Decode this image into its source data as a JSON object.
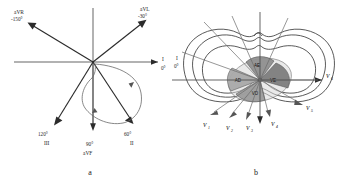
{
  "figure": {
    "background_color": "#ffffff",
    "ink_color": "#1f1f1f"
  },
  "panels": [
    {
      "id": "a",
      "caption": "a",
      "kind": "frontal-plane-hexaxial-reference-with-vector-loop",
      "origin": {
        "x": 93,
        "y": 62
      },
      "axes": {
        "horizontal_label": "I",
        "horizontal_degrees": "0°"
      },
      "leads": [
        {
          "name": "aVR",
          "degrees": "-150°",
          "label_primary": "aVR",
          "label_secondary": "-150°",
          "angle_deg": -150,
          "tip": {
            "x": 28,
            "y": 22
          },
          "label_pos": {
            "x": 14,
            "y": 14
          }
        },
        {
          "name": "aVL",
          "degrees": "-30°",
          "label_primary": "aVL",
          "label_secondary": "-30°",
          "angle_deg": -30,
          "tip": {
            "x": 146,
            "y": 20
          },
          "label_pos": {
            "x": 139,
            "y": 11
          }
        },
        {
          "name": "I",
          "degrees": "0°",
          "label_primary": "I",
          "label_secondary": "0°",
          "angle_deg": 0,
          "tip": {
            "x": 160,
            "y": 62
          },
          "label_pos": {
            "x": 163,
            "y": 60
          }
        },
        {
          "name": "II",
          "degrees": "60°",
          "label_primary": "60°",
          "label_secondary": "II",
          "angle_deg": 60,
          "tip": {
            "x": 133,
            "y": 124
          },
          "label_pos": {
            "x": 125,
            "y": 135
          }
        },
        {
          "name": "aVF",
          "degrees": "90°",
          "label_primary": "90°",
          "label_secondary": "aVF",
          "angle_deg": 90,
          "tip": {
            "x": 93,
            "y": 131
          },
          "label_pos": {
            "x": 88,
            "y": 142
          }
        },
        {
          "name": "III",
          "degrees": "120°",
          "label_primary": "120°",
          "label_secondary": "III",
          "angle_deg": 120,
          "tip": {
            "x": 54,
            "y": 124
          },
          "label_pos": {
            "x": 40,
            "y": 135
          }
        }
      ],
      "vector_loop": {
        "present": true,
        "description": "QRS vector loop in lower-right quadrant",
        "direction_markers": 2
      }
    },
    {
      "id": "b",
      "caption": "b",
      "kind": "horizontal-plane-precordial-leads-thorax-cross-section",
      "axis_label": "I",
      "axis_degrees": "0°",
      "chambers": [
        {
          "code": "AE",
          "position": "superior-right-of-center"
        },
        {
          "code": "AD",
          "position": "left-of-center"
        },
        {
          "code": "VE",
          "position": "right-of-center"
        },
        {
          "code": "VD",
          "position": "inferior-of-center"
        }
      ],
      "precordial_leads": [
        {
          "name": "V1",
          "base": "V",
          "sub": "1",
          "label_pos": {
            "x": 35,
            "y": 128
          },
          "tip": {
            "x": 42,
            "y": 118
          }
        },
        {
          "name": "V2",
          "base": "V",
          "sub": "2",
          "label_pos": {
            "x": 58,
            "y": 130
          },
          "tip": {
            "x": 59,
            "y": 120
          }
        },
        {
          "name": "V3",
          "base": "V",
          "sub": "3",
          "label_pos": {
            "x": 78,
            "y": 129
          },
          "tip": {
            "x": 75,
            "y": 119
          }
        },
        {
          "name": "V4",
          "base": "V",
          "sub": "4",
          "label_pos": {
            "x": 101,
            "y": 125
          },
          "tip": {
            "x": 94,
            "y": 116
          }
        },
        {
          "name": "V5",
          "base": "V",
          "sub": "5",
          "label_pos": {
            "x": 136,
            "y": 110
          },
          "tip": {
            "x": 128,
            "y": 105
          }
        },
        {
          "name": "V6",
          "base": "V",
          "sub": "6",
          "label_pos": {
            "x": 141,
            "y": 80
          },
          "tip": {
            "x": 136,
            "y": 82
          }
        }
      ],
      "thorax": {
        "contour_count": 3,
        "description": "nested thoracic / ribcage / lung outlines"
      }
    }
  ]
}
